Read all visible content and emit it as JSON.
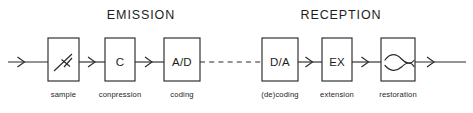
{
  "diagram": {
    "background_color": "#ffffff",
    "line_color": "#2a2a2a",
    "text_color": "#1d1d1d",
    "sections": [
      {
        "id": "emission",
        "label": "EMISSION",
        "center_x": 141,
        "baseline_y": 19
      },
      {
        "id": "reception",
        "label": "RECEPTION",
        "center_x": 341,
        "baseline_y": 19
      }
    ],
    "signal_path": {
      "center_y": 62,
      "input_arrow_label": "input-signal-arrow",
      "output_arrow_label": "output-signal-arrow",
      "dashed_link_label": "transmission-channel-dashed-link"
    },
    "blocks": [
      {
        "id": "sample",
        "box_label": "",
        "icon": "switch-sampler-icon",
        "caption": "sample",
        "x": 48,
        "y": 38,
        "width": 31,
        "height": 43,
        "section": "emission"
      },
      {
        "id": "compression",
        "box_label": "C",
        "icon": "",
        "caption": "conpression",
        "x": 105,
        "y": 38,
        "width": 30,
        "height": 43,
        "section": "emission"
      },
      {
        "id": "coding",
        "box_label": "A/D",
        "icon": "",
        "caption": "coding",
        "x": 164,
        "y": 38,
        "width": 36,
        "height": 43,
        "section": "emission"
      },
      {
        "id": "decoding",
        "box_label": "D/A",
        "icon": "",
        "caption": "(de)coding",
        "x": 262,
        "y": 38,
        "width": 36,
        "height": 43,
        "section": "reception"
      },
      {
        "id": "extension",
        "box_label": "EX",
        "icon": "",
        "caption": "extension",
        "x": 322,
        "y": 38,
        "width": 30,
        "height": 43,
        "section": "reception"
      },
      {
        "id": "restoration",
        "box_label": "",
        "icon": "lowpass-filter-icon",
        "caption": "restoration",
        "x": 381,
        "y": 38,
        "width": 34,
        "height": 43,
        "section": "reception"
      }
    ],
    "captions_baseline_y": 97
  }
}
